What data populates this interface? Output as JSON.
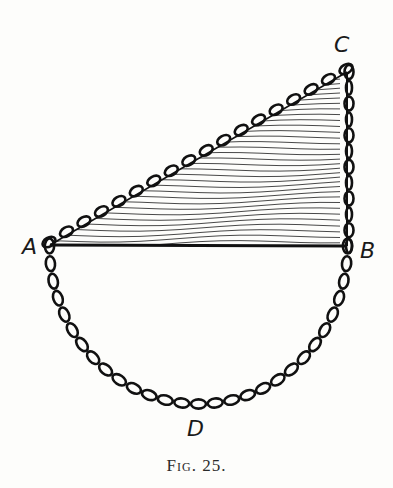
{
  "figure": {
    "caption": "Fig. 25.",
    "labels": {
      "A": "A",
      "B": "B",
      "C": "C",
      "D": "D"
    },
    "points": {
      "A": [
        50,
        245
      ],
      "B": [
        347,
        246
      ],
      "C": [
        347,
        72
      ],
      "D": [
        198,
        404
      ]
    },
    "colors": {
      "ink": "#1a1a1a",
      "background": "#fdfdfb"
    }
  }
}
